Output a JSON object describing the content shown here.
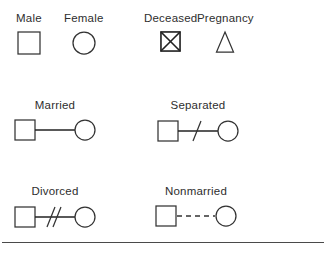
{
  "diagram": {
    "stroke_color": "#333333",
    "background_color": "#ffffff",
    "rule_color": "#4a4a4a",
    "rows": [
      {
        "row_name": "individual-symbols",
        "entries": [
          {
            "label": "Male",
            "symbol": "square"
          },
          {
            "label": "Female",
            "symbol": "circle"
          },
          {
            "label": "Deceased",
            "symbol": "square-with-x"
          },
          {
            "label": "Pregnancy",
            "symbol": "triangle"
          }
        ]
      },
      {
        "row_name": "relationship-symbols-row-1",
        "entries": [
          {
            "label": "Married",
            "symbol": "square-line-circle"
          },
          {
            "label": "Separated",
            "symbol": "square-line-one-slash-circle"
          }
        ]
      },
      {
        "row_name": "relationship-symbols-row-2",
        "entries": [
          {
            "label": "Divorced",
            "symbol": "square-line-two-slashes-circle"
          },
          {
            "label": "Nonmarried",
            "symbol": "square-dashed-line-circle"
          }
        ]
      }
    ]
  },
  "labels": {
    "male": "Male",
    "female": "Female",
    "deceased": "Deceased",
    "pregnancy": "Pregnancy",
    "married": "Married",
    "separated": "Separated",
    "divorced": "Divorced",
    "nonmarried": "Nonmarried"
  }
}
